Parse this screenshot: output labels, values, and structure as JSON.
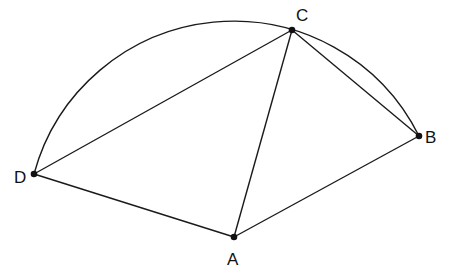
{
  "diagram": {
    "type": "geometry",
    "points": [
      {
        "label": "A",
        "x": 234,
        "y": 237
      },
      {
        "label": "B",
        "x": 419,
        "y": 136
      },
      {
        "label": "C",
        "x": 292,
        "y": 30
      },
      {
        "label": "D",
        "x": 34,
        "y": 174
      }
    ],
    "segments": [
      "DC",
      "CA",
      "CB",
      "DA",
      "AB"
    ],
    "arc": {
      "through": [
        "D",
        "C",
        "B"
      ],
      "center": [
        233.7,
        228.0
      ],
      "radius": 206.9
    },
    "labels": {
      "A": "A",
      "B": "B",
      "C": "C",
      "D": "D"
    },
    "colors": {
      "stroke": "#1a1a1a",
      "background": "#ffffff"
    }
  }
}
